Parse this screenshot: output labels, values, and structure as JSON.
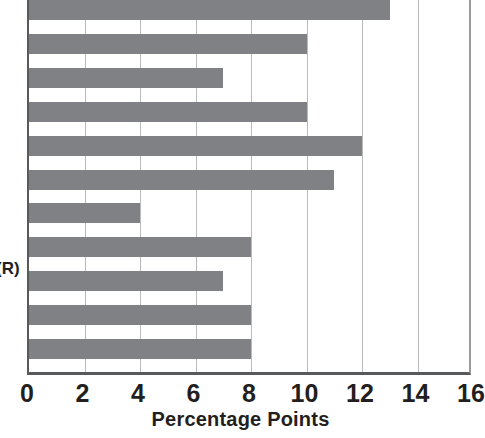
{
  "chart_data": {
    "type": "bar",
    "orientation": "horizontal",
    "title": "",
    "subtitle": "",
    "xlabel": "Percentage Points",
    "ylabel": "",
    "xlim": [
      0,
      16
    ],
    "ylim": null,
    "grid": true,
    "grid_axis": "x",
    "legend": null,
    "legend_position": "none",
    "bar_color": "#808184",
    "axis_color": "#58595b",
    "gridline_color": "#b9babc",
    "text_color": "#231f20",
    "x_ticks": [
      0,
      2,
      4,
      6,
      8,
      10,
      12,
      14,
      16
    ],
    "x_tick_labels": [
      "0",
      "2",
      "4",
      "6",
      "8",
      "10",
      "12",
      "14",
      "16"
    ],
    "categories": [
      "",
      "",
      "",
      "",
      "",
      "",
      "",
      "",
      "(R)",
      "",
      ""
    ],
    "values": [
      13,
      10,
      7,
      10,
      12,
      11,
      4,
      8,
      7,
      8,
      8
    ]
  },
  "axis": {
    "x_title": "Percentage Points",
    "tick_labels": [
      "0",
      "2",
      "4",
      "6",
      "8",
      "10",
      "12",
      "14",
      "16"
    ]
  },
  "category_labels": {
    "partial_visible": "(R)"
  }
}
